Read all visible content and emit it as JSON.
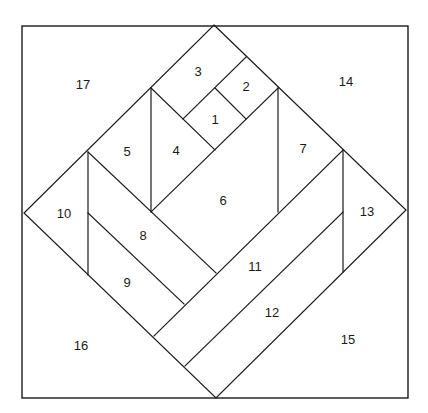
{
  "diagram": {
    "type": "quilt-block-piecing-pattern",
    "stroke_color": "#1a1a1a",
    "background_color": "#ffffff",
    "pieces": [
      {
        "id": "1",
        "label": "1",
        "x": 215,
        "y": 119
      },
      {
        "id": "2",
        "label": "2",
        "x": 246,
        "y": 86
      },
      {
        "id": "3",
        "label": "3",
        "x": 198,
        "y": 71
      },
      {
        "id": "4",
        "label": "4",
        "x": 176,
        "y": 150
      },
      {
        "id": "5",
        "label": "5",
        "x": 127,
        "y": 151
      },
      {
        "id": "6",
        "label": "6",
        "x": 223,
        "y": 200
      },
      {
        "id": "7",
        "label": "7",
        "x": 303,
        "y": 148
      },
      {
        "id": "8",
        "label": "8",
        "x": 143,
        "y": 235
      },
      {
        "id": "9",
        "label": "9",
        "x": 127,
        "y": 282
      },
      {
        "id": "10",
        "label": "10",
        "x": 64,
        "y": 213
      },
      {
        "id": "11",
        "label": "11",
        "x": 255,
        "y": 266
      },
      {
        "id": "12",
        "label": "12",
        "x": 272,
        "y": 312
      },
      {
        "id": "13",
        "label": "13",
        "x": 367,
        "y": 211
      },
      {
        "id": "14",
        "label": "14",
        "x": 346,
        "y": 81
      },
      {
        "id": "15",
        "label": "15",
        "x": 348,
        "y": 339
      },
      {
        "id": "16",
        "label": "16",
        "x": 81,
        "y": 345
      },
      {
        "id": "17",
        "label": "17",
        "x": 83,
        "y": 84
      }
    ]
  }
}
